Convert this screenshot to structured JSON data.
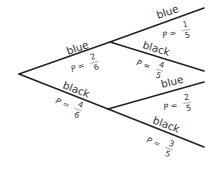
{
  "diagram": {
    "type": "probability-tree",
    "first_stage": [
      {
        "label": "blue",
        "p_prefix": "P =",
        "num": "2",
        "den": "6"
      },
      {
        "label": "black",
        "p_prefix": "P =",
        "num": "4",
        "den": "6"
      }
    ],
    "second_stage_after_blue": [
      {
        "label": "blue",
        "p_prefix": "P =",
        "num": "1",
        "den": "5"
      },
      {
        "label": "black",
        "p_prefix": "P =",
        "num": "4",
        "den": "5"
      }
    ],
    "second_stage_after_black": [
      {
        "label": "blue",
        "p_prefix": "P =",
        "num": "2",
        "den": "5"
      },
      {
        "label": "black",
        "p_prefix": "P =",
        "num": "3",
        "den": "5"
      }
    ]
  }
}
